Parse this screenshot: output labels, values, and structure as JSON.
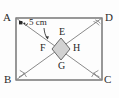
{
  "figure": {
    "background_color": "#fdfdfd",
    "stroke_color": "#6b6b6b",
    "rectangle": {
      "stroke_color": "#555555",
      "fill": "none",
      "x": 16,
      "y": 18,
      "width": 86,
      "height": 62,
      "vertices": [
        {
          "name": "A",
          "label": "A",
          "position": "top-left",
          "x": 16,
          "y": 18
        },
        {
          "name": "D",
          "label": "D",
          "position": "top-right",
          "x": 102,
          "y": 18
        },
        {
          "name": "B",
          "label": "B",
          "position": "bottom-left",
          "x": 16,
          "y": 80
        },
        {
          "name": "C",
          "label": "C",
          "position": "bottom-right",
          "x": 102,
          "y": 80
        }
      ]
    },
    "diagonals": [
      {
        "name": "diagonal-AC",
        "from": "A",
        "to": "C",
        "stroke_color": "#8a8a8a"
      },
      {
        "name": "diagonal-BD",
        "from": "B",
        "to": "D",
        "stroke_color": "#8a8a8a"
      }
    ],
    "rhombus": {
      "name": "EFGH",
      "fill_color": "#d2d2d2",
      "stroke_color": "#6a6a6a",
      "center_x": 61,
      "center_y": 49,
      "half_width": 9,
      "half_height": 11,
      "vertices": [
        {
          "name": "E",
          "label": "E",
          "position": "top",
          "x": 64,
          "y": 33
        },
        {
          "name": "F",
          "label": "F",
          "position": "left",
          "x": 44,
          "y": 49
        },
        {
          "name": "G",
          "label": "G",
          "position": "bottom",
          "x": 62,
          "y": 66
        },
        {
          "name": "H",
          "label": "H",
          "position": "right",
          "x": 77,
          "y": 49
        }
      ]
    },
    "dimension": {
      "name": "side-measure",
      "label": "5 cm",
      "x": 29,
      "y": 21,
      "arrow_to": "diagonal-AC"
    },
    "marks": {
      "right_angle_at_A": true,
      "angle_arcs": [
        "B",
        "C",
        "D",
        "A"
      ],
      "dot_at_A": true
    }
  }
}
